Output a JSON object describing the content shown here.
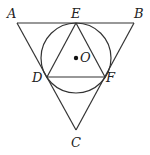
{
  "diagram": {
    "type": "geometry",
    "points": {
      "A": {
        "label": "A",
        "x": 17,
        "y": 23
      },
      "B": {
        "label": "B",
        "x": 134,
        "y": 23
      },
      "C": {
        "label": "C",
        "x": 76,
        "y": 130
      },
      "E": {
        "label": "E",
        "x": 76,
        "y": 23
      },
      "D": {
        "label": "D",
        "x": 47,
        "y": 77
      },
      "F": {
        "label": "F",
        "x": 105,
        "y": 77
      },
      "O": {
        "label": "O",
        "x": 76,
        "y": 58
      }
    },
    "circle": {
      "center": "O",
      "cx": 76,
      "cy": 58,
      "r": 35
    },
    "segments": [
      "AB",
      "AC",
      "BC",
      "DE",
      "EF",
      "DF"
    ],
    "labels": {
      "A": "A",
      "B": "B",
      "C": "C",
      "D": "D",
      "E": "E",
      "F": "F",
      "O": "O"
    }
  }
}
